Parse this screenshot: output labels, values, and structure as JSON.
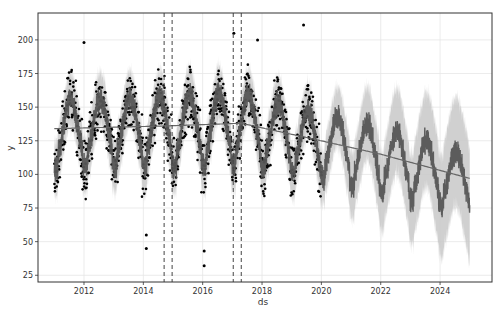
{
  "chart_data": {
    "type": "line",
    "title": "",
    "xlabel": "ds",
    "ylabel": "y",
    "xlim": [
      2010.45,
      2025.75
    ],
    "ylim": [
      20,
      220
    ],
    "x_ticks": [
      2012,
      2014,
      2016,
      2018,
      2020,
      2022,
      2024
    ],
    "x_tick_labels": [
      "2012",
      "2014",
      "2016",
      "2018",
      "2020",
      "2022",
      "2024"
    ],
    "y_ticks": [
      25,
      50,
      75,
      100,
      125,
      150,
      175,
      200
    ],
    "y_tick_labels": [
      "25",
      "50",
      "75",
      "100",
      "125",
      "150",
      "175",
      "200"
    ],
    "grid": true,
    "legend": null,
    "history_range": [
      2011.0,
      2020.0
    ],
    "forecast_range": [
      2020.0,
      2025.0
    ],
    "changepoints": [
      2014.7,
      2014.97,
      2017.03,
      2017.3
    ],
    "series": [
      {
        "name": "observed (y)",
        "style": "scatter",
        "color": "#000000",
        "description": "Daily observations 2011–2020 with annual seasonality, range roughly 75–185, peaks near mid-year and troughs near year start",
        "notable_outliers": [
          {
            "x": 2012.0,
            "y": 198
          },
          {
            "x": 2014.1,
            "y": 45
          },
          {
            "x": 2014.1,
            "y": 55
          },
          {
            "x": 2016.05,
            "y": 32
          },
          {
            "x": 2016.05,
            "y": 43
          },
          {
            "x": 2017.05,
            "y": 205
          },
          {
            "x": 2017.85,
            "y": 200
          },
          {
            "x": 2019.4,
            "y": 211
          }
        ]
      },
      {
        "name": "trend",
        "style": "line",
        "color": "#666666",
        "x": [
          2011.0,
          2014.7,
          2017.3,
          2020.0,
          2022.0,
          2025.0
        ],
        "values": [
          134,
          136,
          138,
          125,
          115,
          97
        ]
      },
      {
        "name": "yhat",
        "style": "line",
        "color": "#555555",
        "description": "Seasonal forecast oscillating around the trend, amplitude ~25; yearly troughs ~ early each year",
        "annual_peaks": [
          {
            "x": 2011.5,
            "y": 152
          },
          {
            "x": 2012.5,
            "y": 152
          },
          {
            "x": 2013.5,
            "y": 150
          },
          {
            "x": 2014.5,
            "y": 150
          },
          {
            "x": 2015.5,
            "y": 152
          },
          {
            "x": 2016.5,
            "y": 153
          },
          {
            "x": 2017.5,
            "y": 151
          },
          {
            "x": 2018.5,
            "y": 146
          },
          {
            "x": 2019.5,
            "y": 142
          },
          {
            "x": 2020.5,
            "y": 138
          },
          {
            "x": 2021.5,
            "y": 132
          },
          {
            "x": 2022.5,
            "y": 126
          },
          {
            "x": 2023.5,
            "y": 120
          },
          {
            "x": 2024.5,
            "y": 114
          }
        ],
        "annual_troughs": [
          {
            "x": 2011.05,
            "y": 100
          },
          {
            "x": 2012.05,
            "y": 103
          },
          {
            "x": 2013.05,
            "y": 100
          },
          {
            "x": 2014.05,
            "y": 98
          },
          {
            "x": 2015.05,
            "y": 98
          },
          {
            "x": 2016.05,
            "y": 98
          },
          {
            "x": 2017.05,
            "y": 100
          },
          {
            "x": 2018.05,
            "y": 97
          },
          {
            "x": 2019.05,
            "y": 95
          },
          {
            "x": 2020.05,
            "y": 92
          },
          {
            "x": 2021.05,
            "y": 86
          },
          {
            "x": 2022.05,
            "y": 80
          },
          {
            "x": 2023.05,
            "y": 75
          },
          {
            "x": 2024.05,
            "y": 70
          },
          {
            "x": 2025.0,
            "y": 78
          }
        ]
      },
      {
        "name": "uncertainty interval",
        "style": "area",
        "color": "#c8c8c8",
        "description": "Band around yhat; ~±20 in history, widening to ~±40 by 2025"
      }
    ]
  }
}
